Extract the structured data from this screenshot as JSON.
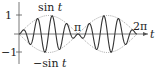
{
  "labels": {
    "y_top": "1",
    "y_bottom": "−1",
    "upper_envelope": "sin t",
    "lower_envelope": "−sin t",
    "pi": "π",
    "two_pi": "2π",
    "x_axis": "t"
  },
  "colors": {
    "axis": "#555555",
    "curve": "#333333",
    "envelope": "#888888"
  },
  "chart_data": {
    "type": "line",
    "title": "",
    "xlabel": "t",
    "ylabel": "",
    "x_ticks": [
      "π",
      "2π"
    ],
    "y_ticks": [
      "1",
      "−1"
    ],
    "xlim": [
      0,
      6.6
    ],
    "ylim": [
      -1.2,
      1.2
    ],
    "series": [
      {
        "name": "sin t",
        "style": "dotted",
        "function": "sin(t)"
      },
      {
        "name": "−sin t",
        "style": "dotted",
        "function": "-sin(t)"
      },
      {
        "name": "modulated",
        "style": "solid",
        "function": "sin(t)*sin(8t)"
      }
    ]
  }
}
